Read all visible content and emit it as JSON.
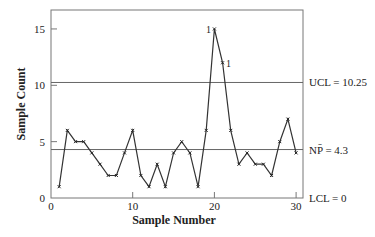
{
  "chart_data": {
    "type": "line",
    "title": "",
    "xlabel": "Sample Number",
    "ylabel": "Sample Count",
    "xlim": [
      0,
      31
    ],
    "ylim": [
      0,
      16.7
    ],
    "x_ticks": [
      0,
      10,
      20,
      30
    ],
    "y_ticks": [
      0,
      5,
      10,
      15
    ],
    "grid": false,
    "legend": "none",
    "x": [
      1,
      2,
      3,
      4,
      5,
      6,
      7,
      8,
      9,
      10,
      11,
      12,
      13,
      14,
      15,
      16,
      17,
      18,
      19,
      20,
      21,
      22,
      23,
      24,
      25,
      26,
      27,
      28,
      29,
      30
    ],
    "series": [
      {
        "name": "Sample Count",
        "values": [
          1,
          6,
          5,
          5,
          4,
          3,
          2,
          2,
          4,
          6,
          2,
          1,
          3,
          1,
          4,
          5,
          4,
          1,
          6,
          15,
          12,
          6,
          3,
          4,
          3,
          3,
          2,
          5,
          7,
          4
        ]
      }
    ],
    "reference_lines": [
      {
        "name": "UCL",
        "value": 10.25,
        "label": "UCL = 10.25"
      },
      {
        "name": "NP-bar",
        "value": 4.3,
        "label": "NP̄ = 4.3"
      },
      {
        "name": "LCL",
        "value": 0,
        "label": "LCL = 0"
      }
    ],
    "annotations": [
      {
        "x": 20,
        "y": 15,
        "text": "1",
        "side": "left"
      },
      {
        "x": 21,
        "y": 12,
        "text": "1",
        "side": "right"
      }
    ]
  },
  "colors": {
    "line": "#333333",
    "frame": "#777777",
    "text": "#222222"
  }
}
